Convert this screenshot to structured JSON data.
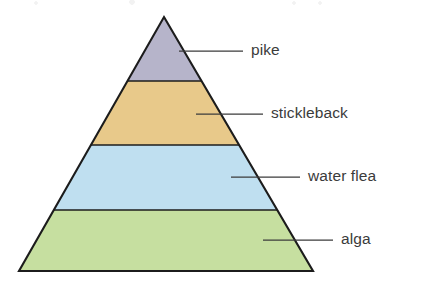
{
  "figure": {
    "type": "ecological-pyramid",
    "orientation": "upright-triangle",
    "background_color": "#ffffff",
    "outline_color": "#1c1c1c",
    "label_text_color": "#3b3b3b",
    "leader_line_color": "#3b3b3b"
  },
  "chart_data": {
    "type": "pie",
    "title": "",
    "xlabel": "",
    "ylabel": "",
    "categories": [
      "pike",
      "stickleback",
      "water flea",
      "alga"
    ],
    "values": [
      8,
      22,
      28,
      42
    ],
    "legend_position": "right",
    "grid": false
  },
  "pyramid": {
    "apex": {
      "x": 164,
      "y": 17
    },
    "base_left": {
      "x": 19,
      "y": 271
    },
    "base_right": {
      "x": 313,
      "y": 271
    },
    "bands": [
      {
        "id": "pike",
        "label": "pike",
        "color": "#b6b4ca",
        "top_y": 17,
        "bottom_y": 81,
        "trophic_level": 4,
        "leader": {
          "x1": 179,
          "y1": 51,
          "x2": 243,
          "y2": 51
        },
        "label_x": 251,
        "label_y": 51
      },
      {
        "id": "stickleback",
        "label": "stickleback",
        "color": "#e8c98a",
        "top_y": 81,
        "bottom_y": 145,
        "trophic_level": 3,
        "leader": {
          "x1": 196,
          "y1": 114,
          "x2": 263,
          "y2": 114
        },
        "label_x": 271,
        "label_y": 114
      },
      {
        "id": "water-flea",
        "label": "water flea",
        "color": "#bfdff0",
        "top_y": 145,
        "bottom_y": 210,
        "trophic_level": 2,
        "leader": {
          "x1": 231,
          "y1": 177,
          "x2": 300,
          "y2": 177
        },
        "label_x": 308,
        "label_y": 177
      },
      {
        "id": "alga",
        "label": "alga",
        "color": "#c6dfa0",
        "top_y": 210,
        "bottom_y": 271,
        "trophic_level": 1,
        "leader": {
          "x1": 263,
          "y1": 240,
          "x2": 333,
          "y2": 240
        },
        "label_x": 341,
        "label_y": 240
      }
    ]
  }
}
